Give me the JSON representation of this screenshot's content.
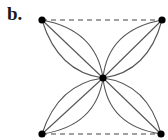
{
  "figure": {
    "label": "b."
  },
  "graph": {
    "nodes": [
      {
        "id": "top-left",
        "x": 42,
        "y": 20
      },
      {
        "id": "top-right",
        "x": 162,
        "y": 20
      },
      {
        "id": "center",
        "x": 103,
        "y": 78
      },
      {
        "id": "bottom-left",
        "x": 42,
        "y": 134
      },
      {
        "id": "bottom-right",
        "x": 161,
        "y": 134
      }
    ],
    "petal_edges_per_pair": 3,
    "petals": [
      "top-left",
      "top-right",
      "bottom-left",
      "bottom-right"
    ],
    "dashed_edges": [
      [
        "top-left",
        "top-right"
      ],
      [
        "bottom-left",
        "bottom-right"
      ]
    ],
    "colors": {
      "edge": "#555555",
      "node": "#000000",
      "dashed": "#444444"
    }
  }
}
